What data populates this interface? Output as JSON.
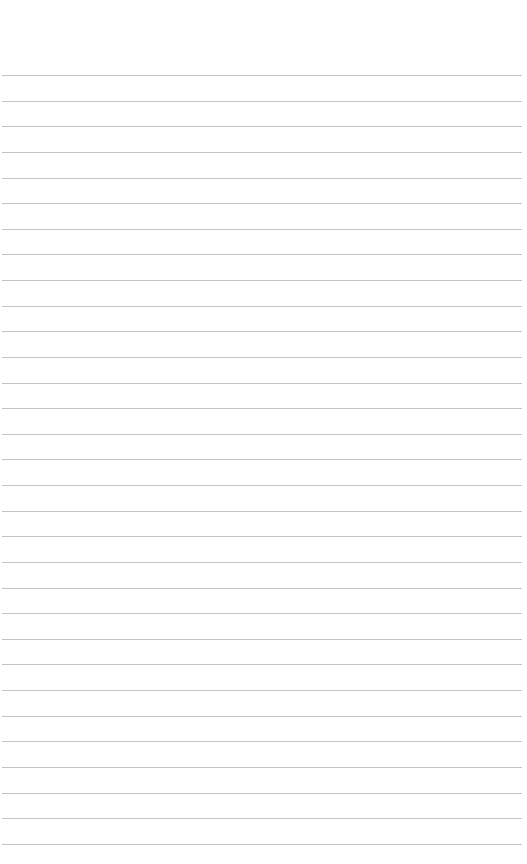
{
  "page": {
    "type": "lined-paper",
    "background": "#ffffff",
    "rule_color": "#c4c4c4",
    "first_rule_y": 75,
    "rule_spacing": 25.63,
    "rule_count": 31
  }
}
